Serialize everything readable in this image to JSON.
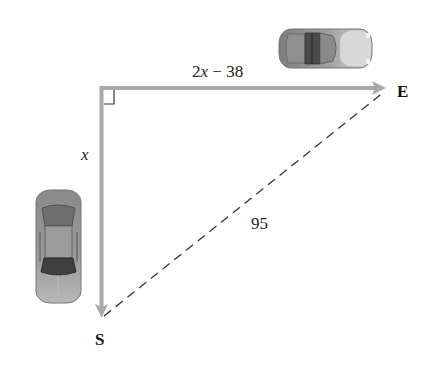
{
  "diagram": {
    "type": "right-triangle-word-problem",
    "labels": {
      "horizontal_leg": "2x − 38",
      "horizontal_leg_var": "x",
      "horizontal_leg_coef": "2",
      "horizontal_leg_rest": " − 38",
      "vertical_leg": "x",
      "hypotenuse": "95",
      "east_point": "E",
      "south_point": "S"
    },
    "icons": {
      "top_car": "car-topview-icon",
      "left_car": "car-topview-icon",
      "right_angle": "right-angle-marker-icon"
    },
    "colors": {
      "leg_arrows": "#a9a9a9",
      "hypotenuse": "#333333",
      "text": "#222222",
      "car_body": "#9a9a9a",
      "car_window": "#555555",
      "background": "#ffffff"
    }
  }
}
